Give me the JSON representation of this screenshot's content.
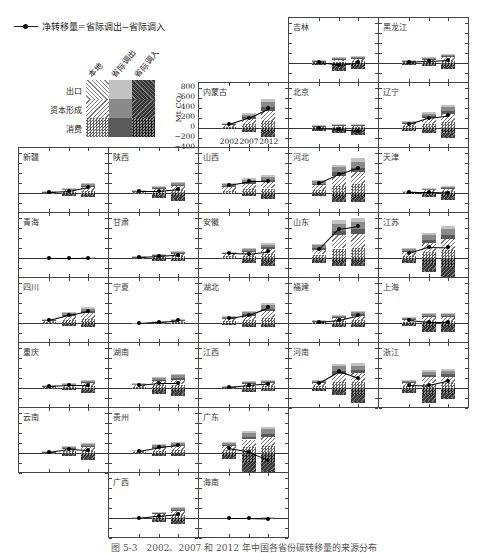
{
  "legend": {
    "net_line_label": "净转移量=省际调出−省际调入",
    "columns": [
      "本地",
      "省际调出",
      "省际调入"
    ],
    "rows": [
      "出口",
      "资本形成",
      "消费"
    ]
  },
  "axis": {
    "ylabel": "Mt CO₂",
    "yticks": [
      800,
      600,
      400,
      200,
      0,
      -200,
      -400
    ],
    "ylim": [
      -400,
      900
    ],
    "xticks": [
      "2002",
      "2007",
      "2012"
    ]
  },
  "caption": "图 5-3　2002、2007 和 2012 年中国各省份碳转移量的来源分布",
  "colors": {
    "local_export": "#f4f4f4",
    "local_capital": "#e6e6e6",
    "local_consumption": "#b8b8b8",
    "out_export": "#c2c2c2",
    "out_capital": "#8a8a8a",
    "out_consumption": "#5a5a5a",
    "in_export": "#6e6e6e",
    "in_capital": "#4a4a4a",
    "in_consumption": "#3a3a3a"
  },
  "chart_data": {
    "type": "bar",
    "xlabel": "",
    "ylabel": "Mt CO₂",
    "ylim": [
      -400,
      900
    ],
    "categories": [
      "2002",
      "2007",
      "2012"
    ],
    "series_note": "Positive stack = 省际调出 (outflow by 消费/资本形成/出口), negative stack = 省际调入 (inflow); black line = 净转移量",
    "legend": [
      "本地-出口",
      "本地-资本形成",
      "本地-消费",
      "省际调出-出口",
      "省际调出-资本形成",
      "省际调出-消费",
      "省际调入-出口",
      "省际调入-资本形成",
      "省际调入-消费",
      "净转移量"
    ],
    "panels": [
      {
        "name": "吉林",
        "row": 0,
        "col": 3,
        "out": [
          60,
          120,
          150
        ],
        "in": [
          -40,
          -150,
          -130
        ],
        "net": [
          20,
          -30,
          20
        ]
      },
      {
        "name": "黑龙江",
        "row": 0,
        "col": 4,
        "out": [
          60,
          120,
          190
        ],
        "in": [
          -40,
          -70,
          -120
        ],
        "net": [
          20,
          50,
          70
        ]
      },
      {
        "name": "内蒙古",
        "row": 1,
        "col": 2,
        "out": [
          110,
          300,
          580
        ],
        "in": [
          -30,
          -90,
          -180
        ],
        "net": [
          80,
          210,
          400
        ]
      },
      {
        "name": "北京",
        "row": 1,
        "col": 3,
        "out": [
          60,
          80,
          80
        ],
        "in": [
          -60,
          -100,
          -140
        ],
        "net": [
          0,
          -20,
          -60
        ]
      },
      {
        "name": "辽宁",
        "row": 1,
        "col": 4,
        "out": [
          150,
          320,
          460
        ],
        "in": [
          -70,
          -110,
          -200
        ],
        "net": [
          80,
          210,
          260
        ]
      },
      {
        "name": "新疆",
        "row": 2,
        "col": 0,
        "out": [
          40,
          100,
          200
        ],
        "in": [
          -20,
          -60,
          -80
        ],
        "net": [
          20,
          40,
          120
        ]
      },
      {
        "name": "陕西",
        "row": 2,
        "col": 1,
        "out": [
          60,
          140,
          230
        ],
        "in": [
          -20,
          -100,
          -150
        ],
        "net": [
          40,
          40,
          80
        ]
      },
      {
        "name": "山西",
        "row": 2,
        "col": 2,
        "out": [
          200,
          300,
          360
        ],
        "in": [
          -30,
          -60,
          -120
        ],
        "net": [
          170,
          240,
          240
        ]
      },
      {
        "name": "河北",
        "row": 2,
        "col": 3,
        "out": [
          260,
          570,
          700
        ],
        "in": [
          -60,
          -190,
          -190
        ],
        "net": [
          200,
          380,
          510
        ]
      },
      {
        "name": "天津",
        "row": 2,
        "col": 4,
        "out": [
          50,
          100,
          150
        ],
        "in": [
          -30,
          -80,
          -140
        ],
        "net": [
          20,
          20,
          10
        ]
      },
      {
        "name": "青海",
        "row": 3,
        "col": 0,
        "out": [
          5,
          5,
          20
        ],
        "in": [
          -5,
          -5,
          -20
        ],
        "net": [
          0,
          0,
          0
        ]
      },
      {
        "name": "甘肃",
        "row": 3,
        "col": 1,
        "out": [
          40,
          90,
          140
        ],
        "in": [
          -20,
          -50,
          -70
        ],
        "net": [
          20,
          40,
          70
        ]
      },
      {
        "name": "安徽",
        "row": 3,
        "col": 2,
        "out": [
          130,
          200,
          300
        ],
        "in": [
          -30,
          -110,
          -160
        ],
        "net": [
          100,
          90,
          140
        ]
      },
      {
        "name": "山东",
        "row": 3,
        "col": 3,
        "out": [
          280,
          760,
          810
        ],
        "in": [
          -100,
          -170,
          -160
        ],
        "net": [
          180,
          590,
          650
        ]
      },
      {
        "name": "江苏",
        "row": 3,
        "col": 4,
        "out": [
          200,
          510,
          640
        ],
        "in": [
          -100,
          -280,
          -420
        ],
        "net": [
          100,
          230,
          220
        ]
      },
      {
        "name": "四川",
        "row": 4,
        "col": 0,
        "out": [
          80,
          220,
          320
        ],
        "in": [
          -20,
          -60,
          -80
        ],
        "net": [
          60,
          160,
          240
        ]
      },
      {
        "name": "宁夏",
        "row": 4,
        "col": 1,
        "out": [
          10,
          50,
          90
        ],
        "in": [
          -5,
          -20,
          -30
        ],
        "net": [
          5,
          30,
          60
        ]
      },
      {
        "name": "湖北",
        "row": 4,
        "col": 2,
        "out": [
          150,
          250,
          400
        ],
        "in": [
          -40,
          -80,
          -80
        ],
        "net": [
          110,
          170,
          320
        ]
      },
      {
        "name": "福建",
        "row": 4,
        "col": 3,
        "out": [
          60,
          160,
          240
        ],
        "in": [
          -30,
          -90,
          -80
        ],
        "net": [
          30,
          70,
          160
        ]
      },
      {
        "name": "上海",
        "row": 4,
        "col": 4,
        "out": [
          120,
          200,
          200
        ],
        "in": [
          -60,
          -180,
          -180
        ],
        "net": [
          60,
          20,
          20
        ]
      },
      {
        "name": "重庆",
        "row": 5,
        "col": 0,
        "out": [
          60,
          100,
          170
        ],
        "in": [
          -20,
          -40,
          -110
        ],
        "net": [
          40,
          60,
          60
        ]
      },
      {
        "name": "湖南",
        "row": 5,
        "col": 1,
        "out": [
          100,
          230,
          280
        ],
        "in": [
          -30,
          -120,
          -170
        ],
        "net": [
          70,
          110,
          110
        ]
      },
      {
        "name": "江西",
        "row": 5,
        "col": 2,
        "out": [
          40,
          140,
          160
        ],
        "in": [
          -20,
          -80,
          -70
        ],
        "net": [
          20,
          60,
          90
        ]
      },
      {
        "name": "河南",
        "row": 5,
        "col": 3,
        "out": [
          160,
          480,
          500
        ],
        "in": [
          -50,
          -140,
          -300
        ],
        "net": [
          110,
          340,
          200
        ]
      },
      {
        "name": "浙江",
        "row": 5,
        "col": 4,
        "out": [
          170,
          360,
          380
        ],
        "in": [
          -100,
          -300,
          -230
        ],
        "net": [
          70,
          60,
          150
        ]
      },
      {
        "name": "云南",
        "row": 6,
        "col": 0,
        "out": [
          40,
          140,
          200
        ],
        "in": [
          -20,
          -60,
          -140
        ],
        "net": [
          20,
          80,
          60
        ]
      },
      {
        "name": "贵州",
        "row": 6,
        "col": 1,
        "out": [
          70,
          180,
          220
        ],
        "in": [
          -20,
          -60,
          -60
        ],
        "net": [
          50,
          120,
          160
        ]
      },
      {
        "name": "广东",
        "row": 6,
        "col": 2,
        "out": [
          230,
          450,
          530
        ],
        "in": [
          -130,
          -420,
          -400
        ],
        "net": [
          100,
          30,
          -130
        ]
      },
      {
        "name": "广西",
        "row": 7,
        "col": 1,
        "out": [
          20,
          130,
          220
        ],
        "in": [
          -20,
          -80,
          -130
        ],
        "net": [
          0,
          50,
          90
        ]
      },
      {
        "name": "海南",
        "row": 7,
        "col": 2,
        "out": [
          5,
          5,
          20
        ],
        "in": [
          -5,
          -5,
          -20
        ],
        "net": [
          0,
          0,
          -10
        ]
      }
    ]
  }
}
